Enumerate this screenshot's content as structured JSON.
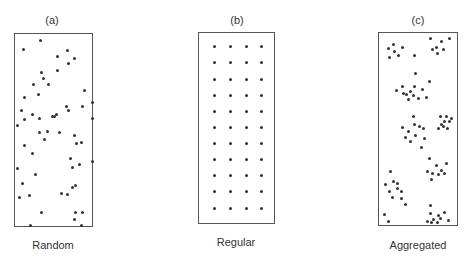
{
  "panels": [
    {
      "id": "a",
      "letter": "(a)",
      "caption": "Random",
      "box": {
        "x": 14,
        "y": 33,
        "w": 79,
        "h": 194
      },
      "letter_pos": {
        "x": 32,
        "y": 14
      },
      "caption_pos": {
        "x": 3,
        "y": 239
      },
      "points": [
        [
          40,
          40
        ],
        [
          23,
          49
        ],
        [
          57,
          56
        ],
        [
          67,
          50
        ],
        [
          74,
          58
        ],
        [
          68,
          63
        ],
        [
          41,
          72
        ],
        [
          57,
          70
        ],
        [
          43,
          78
        ],
        [
          33,
          84
        ],
        [
          48,
          84
        ],
        [
          84,
          90
        ],
        [
          38,
          94
        ],
        [
          24,
          97
        ],
        [
          82,
          106
        ],
        [
          66,
          106
        ],
        [
          92,
          102
        ],
        [
          21,
          110
        ],
        [
          68,
          110
        ],
        [
          32,
          114
        ],
        [
          24,
          119
        ],
        [
          39,
          118
        ],
        [
          52,
          116
        ],
        [
          54,
          116
        ],
        [
          56,
          114
        ],
        [
          92,
          118
        ],
        [
          17,
          125
        ],
        [
          39,
          132
        ],
        [
          47,
          131
        ],
        [
          59,
          132
        ],
        [
          44,
          139
        ],
        [
          74,
          135
        ],
        [
          24,
          145
        ],
        [
          76,
          143
        ],
        [
          81,
          142
        ],
        [
          32,
          153
        ],
        [
          70,
          158
        ],
        [
          92,
          161
        ],
        [
          79,
          164
        ],
        [
          17,
          168
        ],
        [
          72,
          167
        ],
        [
          35,
          174
        ],
        [
          22,
          183
        ],
        [
          72,
          187
        ],
        [
          75,
          185
        ],
        [
          19,
          197
        ],
        [
          29,
          195
        ],
        [
          61,
          193
        ],
        [
          67,
          194
        ],
        [
          41,
          212
        ],
        [
          75,
          212
        ],
        [
          82,
          212
        ],
        [
          74,
          219
        ],
        [
          30,
          225
        ],
        [
          81,
          225
        ]
      ]
    },
    {
      "id": "b",
      "letter": "(b)",
      "caption": "Regular",
      "box": {
        "x": 198,
        "y": 32,
        "w": 77,
        "h": 192
      },
      "letter_pos": {
        "x": 217,
        "y": 14
      },
      "caption_pos": {
        "x": 186,
        "y": 236
      },
      "grid": {
        "columns_x": [
          214,
          230,
          246,
          261
        ],
        "rows_y": [
          46,
          62,
          79,
          95,
          111,
          127,
          143,
          159,
          175,
          191,
          208
        ]
      }
    },
    {
      "id": "c",
      "letter": "(c)",
      "caption": "Aggregated",
      "box": {
        "x": 378,
        "y": 32,
        "w": 80,
        "h": 194
      },
      "letter_pos": {
        "x": 398,
        "y": 14
      },
      "caption_pos": {
        "x": 368,
        "y": 239
      },
      "points": [
        [
          388,
          48
        ],
        [
          393,
          44
        ],
        [
          402,
          47
        ],
        [
          394,
          51
        ],
        [
          398,
          55
        ],
        [
          389,
          57
        ],
        [
          414,
          55
        ],
        [
          430,
          38
        ],
        [
          441,
          41
        ],
        [
          449,
          38
        ],
        [
          432,
          49
        ],
        [
          436,
          47
        ],
        [
          443,
          49
        ],
        [
          437,
          53
        ],
        [
          415,
          73
        ],
        [
          429,
          81
        ],
        [
          402,
          86
        ],
        [
          414,
          86
        ],
        [
          422,
          89
        ],
        [
          406,
          94
        ],
        [
          410,
          91
        ],
        [
          413,
          95
        ],
        [
          418,
          98
        ],
        [
          408,
          99
        ],
        [
          403,
          93
        ],
        [
          426,
          97
        ],
        [
          396,
          90
        ],
        [
          413,
          116
        ],
        [
          402,
          127
        ],
        [
          414,
          124
        ],
        [
          419,
          126
        ],
        [
          423,
          128
        ],
        [
          408,
          131
        ],
        [
          415,
          135
        ],
        [
          424,
          138
        ],
        [
          405,
          137
        ],
        [
          410,
          141
        ],
        [
          421,
          147
        ],
        [
          440,
          116
        ],
        [
          446,
          116
        ],
        [
          451,
          118
        ],
        [
          444,
          121
        ],
        [
          449,
          121
        ],
        [
          441,
          124
        ],
        [
          443,
          126
        ],
        [
          447,
          128
        ],
        [
          438,
          128
        ],
        [
          429,
          158
        ],
        [
          436,
          165
        ],
        [
          441,
          170
        ],
        [
          432,
          173
        ],
        [
          446,
          163
        ],
        [
          438,
          174
        ],
        [
          427,
          171
        ],
        [
          444,
          173
        ],
        [
          431,
          179
        ],
        [
          390,
          171
        ],
        [
          393,
          181
        ],
        [
          385,
          184
        ],
        [
          397,
          183
        ],
        [
          397,
          188
        ],
        [
          389,
          191
        ],
        [
          401,
          191
        ],
        [
          392,
          197
        ],
        [
          401,
          198
        ],
        [
          405,
          204
        ],
        [
          430,
          205
        ],
        [
          430,
          213
        ],
        [
          438,
          215
        ],
        [
          444,
          212
        ],
        [
          433,
          219
        ],
        [
          440,
          218
        ],
        [
          437,
          222
        ],
        [
          427,
          221
        ],
        [
          431,
          222
        ],
        [
          448,
          220
        ],
        [
          384,
          214
        ],
        [
          388,
          221
        ]
      ]
    }
  ]
}
